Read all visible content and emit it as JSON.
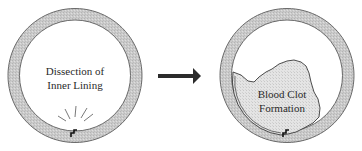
{
  "diagram": {
    "left_panel": {
      "label_line1": "Dissection of",
      "label_line2": "Inner Lining"
    },
    "arrow": {
      "direction": "right"
    },
    "right_panel": {
      "label_line1": "Blood Clot",
      "label_line2": "Formation"
    },
    "colors": {
      "vessel_wall": "#c9c9c9",
      "vessel_outline": "#6a6a6a",
      "clot_fill": "#e2e2e2",
      "arrow": "#2b2b2b",
      "text": "#2a2a2a"
    }
  }
}
